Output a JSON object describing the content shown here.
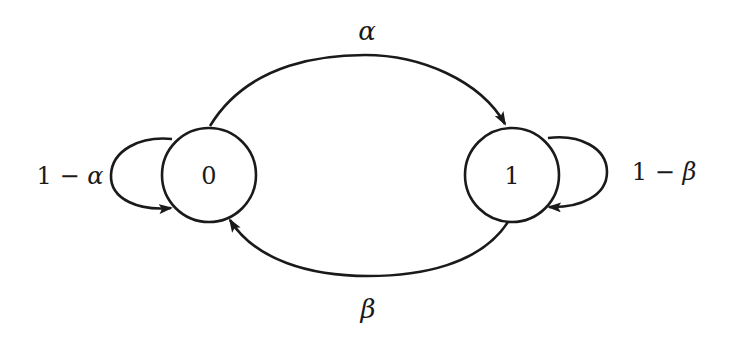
{
  "diagram": {
    "type": "markov-chain-state-diagram",
    "states": [
      {
        "id": "0",
        "label": "0"
      },
      {
        "id": "1",
        "label": "1"
      }
    ],
    "transitions": [
      {
        "from": "0",
        "to": "1",
        "label": "α"
      },
      {
        "from": "1",
        "to": "0",
        "label": "β"
      },
      {
        "from": "0",
        "to": "0",
        "label": "1 − α"
      },
      {
        "from": "1",
        "to": "1",
        "label": "1 − β"
      }
    ],
    "labels": {
      "state0": "0",
      "state1": "1",
      "alpha": "α",
      "beta": "β",
      "self0_prefix": "1 − ",
      "self0_var": "α",
      "self1_prefix": "1 − ",
      "self1_var": "β"
    },
    "colors": {
      "stroke": "#1a1a1a",
      "background": "#ffffff"
    }
  }
}
